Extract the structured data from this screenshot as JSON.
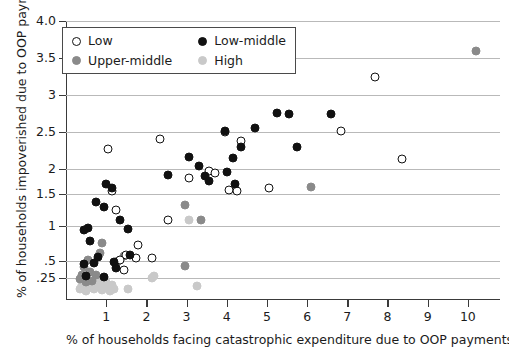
{
  "chart_data": {
    "type": "scatter",
    "title": "",
    "xlabel": "% of households facing catastrophic expenditure due to OOP payments",
    "ylabel": "% of households impoverished due to OOP payments",
    "grid": true,
    "legend_position": "top-left-inside",
    "xlim": [
      0.0,
      10.8
    ],
    "ylim": [
      0.0,
      4.15
    ],
    "xticks": [
      1,
      2,
      3,
      4,
      5,
      6,
      7,
      8,
      9,
      10
    ],
    "xtick_labels": [
      "1",
      "2",
      "3",
      "4",
      "5",
      "6",
      "7",
      "8",
      "9",
      "10"
    ],
    "yticks": [
      0.25,
      0.5,
      1,
      1.5,
      2,
      2.5,
      3,
      3.5,
      4.0
    ],
    "ytick_labels": [
      ".25",
      ".5",
      "1",
      "1.5",
      "2",
      "2.5",
      "3",
      "3.5",
      "4.0"
    ],
    "y_scale_note": "non-linear (square-root-like) below 1",
    "series": [
      {
        "name": "Low",
        "key": "low",
        "marker": "open-circle",
        "color": "#ffffff",
        "edge_color": "#111111",
        "points": [
          [
            1.05,
            2.27
          ],
          [
            2.35,
            2.41
          ],
          [
            3.05,
            1.82
          ],
          [
            3.55,
            1.97
          ],
          [
            3.7,
            1.93
          ],
          [
            3.95,
            2.5
          ],
          [
            4.35,
            2.38
          ],
          [
            4.05,
            1.58
          ],
          [
            4.25,
            1.56
          ],
          [
            5.05,
            1.62
          ],
          [
            6.85,
            2.51
          ],
          [
            7.7,
            3.25
          ],
          [
            8.35,
            2.13
          ],
          [
            1.15,
            1.57
          ],
          [
            1.25,
            1.25
          ],
          [
            2.15,
            0.55
          ],
          [
            1.5,
            0.58
          ],
          [
            1.35,
            0.52
          ],
          [
            1.75,
            0.54
          ],
          [
            1.45,
            0.37
          ],
          [
            1.8,
            0.73
          ],
          [
            2.55,
            1.1
          ]
        ]
      },
      {
        "name": "Low-middle",
        "key": "lowmid",
        "marker": "filled-circle",
        "color": "#111111",
        "points": [
          [
            0.45,
            0.95
          ],
          [
            0.55,
            0.97
          ],
          [
            0.6,
            0.78
          ],
          [
            0.75,
            1.37
          ],
          [
            0.95,
            1.3
          ],
          [
            1.0,
            1.7
          ],
          [
            1.15,
            1.62
          ],
          [
            1.35,
            1.1
          ],
          [
            1.55,
            0.96
          ],
          [
            2.55,
            1.89
          ],
          [
            3.05,
            2.16
          ],
          [
            3.3,
            2.04
          ],
          [
            3.45,
            1.86
          ],
          [
            3.55,
            1.77
          ],
          [
            3.95,
            2.52
          ],
          [
            4.0,
            1.95
          ],
          [
            4.15,
            2.15
          ],
          [
            4.2,
            1.71
          ],
          [
            4.35,
            2.3
          ],
          [
            4.7,
            2.56
          ],
          [
            5.25,
            2.76
          ],
          [
            5.55,
            2.74
          ],
          [
            5.75,
            2.3
          ],
          [
            6.6,
            2.75
          ],
          [
            0.7,
            0.47
          ],
          [
            0.95,
            0.27
          ],
          [
            0.45,
            0.46
          ],
          [
            1.2,
            0.49
          ],
          [
            1.25,
            0.4
          ],
          [
            1.6,
            0.58
          ],
          [
            0.8,
            0.56
          ],
          [
            0.5,
            0.28
          ]
        ]
      },
      {
        "name": "Upper-middle",
        "key": "uppermid",
        "marker": "filled-circle",
        "color": "#8a8a8a",
        "points": [
          [
            10.2,
            3.6
          ],
          [
            6.1,
            1.65
          ],
          [
            2.95,
            1.33
          ],
          [
            3.35,
            1.1
          ],
          [
            0.9,
            0.76
          ],
          [
            0.85,
            0.62
          ],
          [
            0.55,
            0.52
          ],
          [
            0.45,
            0.41
          ],
          [
            0.4,
            0.29
          ],
          [
            0.35,
            0.24
          ],
          [
            0.6,
            0.34
          ],
          [
            0.75,
            0.3
          ],
          [
            1.3,
            0.5
          ],
          [
            2.95,
            0.42
          ],
          [
            1.45,
            0.57
          ],
          [
            0.5,
            0.2
          ],
          [
            0.65,
            0.22
          ]
        ]
      },
      {
        "name": "High",
        "key": "high",
        "marker": "filled-circle",
        "color": "#c9c9c9",
        "points": [
          [
            3.05,
            1.1
          ],
          [
            2.2,
            0.28
          ],
          [
            2.15,
            0.25
          ],
          [
            3.25,
            0.16
          ],
          [
            1.55,
            0.13
          ],
          [
            0.35,
            0.12
          ],
          [
            0.45,
            0.13
          ],
          [
            0.55,
            0.14
          ],
          [
            0.65,
            0.15
          ],
          [
            0.75,
            0.16
          ],
          [
            0.85,
            0.15
          ],
          [
            0.95,
            0.14
          ],
          [
            1.05,
            0.16
          ],
          [
            1.15,
            0.17
          ],
          [
            0.4,
            0.17
          ],
          [
            0.6,
            0.18
          ],
          [
            0.8,
            0.19
          ],
          [
            1.0,
            0.2
          ],
          [
            0.7,
            0.12
          ],
          [
            0.9,
            0.11
          ],
          [
            1.2,
            0.12
          ],
          [
            0.5,
            0.1
          ],
          [
            1.1,
            0.1
          ]
        ]
      }
    ]
  },
  "legend": {
    "items": [
      {
        "label": "Low",
        "key": "low"
      },
      {
        "label": "Low-middle",
        "key": "lowmid"
      },
      {
        "label": "Upper-middle",
        "key": "uppermid"
      },
      {
        "label": "High",
        "key": "high"
      }
    ]
  }
}
